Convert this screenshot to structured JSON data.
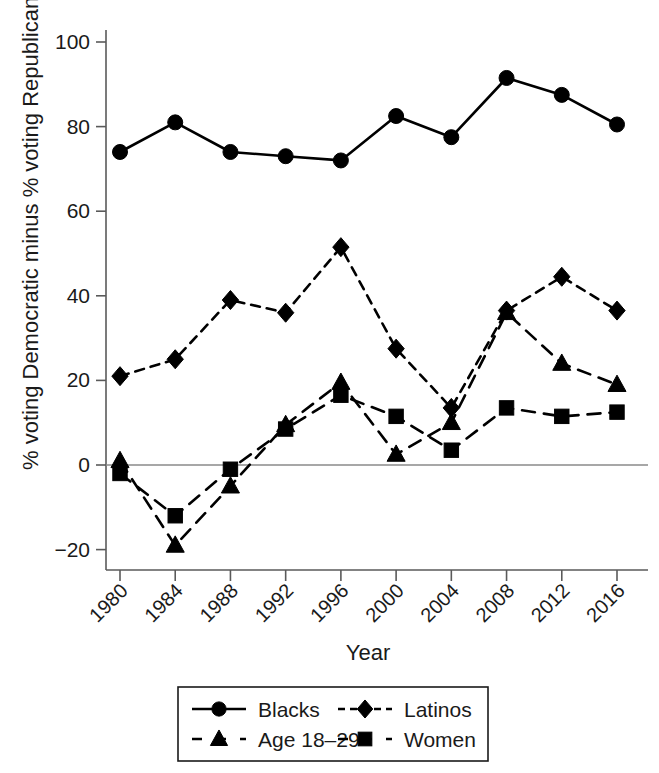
{
  "chart_data": {
    "type": "line",
    "title": "",
    "xlabel": "Year",
    "ylabel": "% voting Democratic minus % voting Republican",
    "categories": [
      1980,
      1984,
      1988,
      1992,
      1996,
      2000,
      2004,
      2008,
      2012,
      2016
    ],
    "xtick_labels": [
      "1980",
      "1984",
      "1988",
      "1992",
      "1996",
      "2000",
      "2004",
      "2008",
      "2012",
      "2016"
    ],
    "ytick_labels": [
      "100",
      "80",
      "60",
      "40",
      "20",
      "0",
      "−20"
    ],
    "ytick_values": [
      100,
      80,
      60,
      40,
      20,
      0,
      -20
    ],
    "ylim": [
      -25,
      105
    ],
    "xlim": [
      1978.5,
      2017.5
    ],
    "grid": false,
    "zero_line": true,
    "legend_position": "below",
    "series": [
      {
        "name": "Blacks",
        "marker": "circle",
        "linestyle": "solid",
        "color": "#000000",
        "values": [
          74,
          81,
          74,
          73,
          72,
          82.5,
          77.5,
          91.5,
          87.5,
          80.5
        ]
      },
      {
        "name": "Latinos",
        "marker": "diamond",
        "linestyle": "dashed",
        "color": "#000000",
        "values": [
          21,
          25,
          39,
          36,
          51.5,
          27.5,
          13.5,
          36.5,
          44.5,
          36.5
        ]
      },
      {
        "name": "Age 18–29",
        "marker": "triangle",
        "linestyle": "dashed-long",
        "color": "#000000",
        "values": [
          1,
          -19,
          -5,
          9.5,
          19.5,
          2.5,
          10,
          36,
          24,
          19
        ]
      },
      {
        "name": "Women",
        "marker": "square",
        "linestyle": "dashed-long",
        "color": "#000000",
        "values": [
          -2,
          -12,
          -1,
          8.5,
          16.5,
          11.5,
          3.5,
          13.5,
          11.5,
          12.5
        ]
      }
    ],
    "legend": [
      {
        "label": "Blacks",
        "marker": "circle",
        "linestyle": "solid"
      },
      {
        "label": "Latinos",
        "marker": "diamond",
        "linestyle": "dashed"
      },
      {
        "label": "Age 18–29",
        "marker": "triangle",
        "linestyle": "dashed-long"
      },
      {
        "label": "Women",
        "marker": "square",
        "linestyle": "dashed-long"
      }
    ]
  }
}
